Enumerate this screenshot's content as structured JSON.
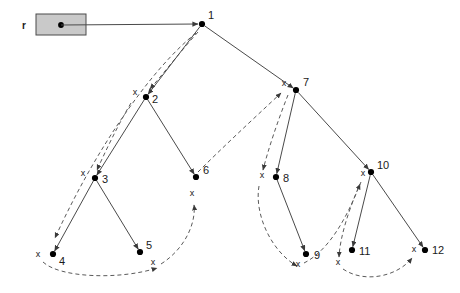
{
  "diagram": {
    "colors": {
      "node": "#000000",
      "edge": "#4a4a4a",
      "thread": "#5a5a5a",
      "root_box_fill": "#c9c9c9",
      "background": "#ffffff",
      "text": "#1a1a1a"
    },
    "root_pointer": {
      "label": "r",
      "box": {
        "x": 36,
        "y": 14,
        "w": 50,
        "h": 21
      },
      "dot": {
        "x": 61,
        "y": 25
      },
      "link_to": "1"
    },
    "nodes": [
      {
        "id": "1",
        "label": "1",
        "x": 202,
        "y": 24,
        "label_dx": 6,
        "label_dy": -5
      },
      {
        "id": "2",
        "label": "2",
        "x": 146,
        "y": 97,
        "label_dx": 6,
        "label_dy": 6
      },
      {
        "id": "3",
        "label": "3",
        "x": 95,
        "y": 178,
        "label_dx": 7,
        "label_dy": 5
      },
      {
        "id": "4",
        "label": "4",
        "x": 53,
        "y": 254,
        "label_dx": 6,
        "label_dy": 11
      },
      {
        "id": "5",
        "label": "5",
        "x": 140,
        "y": 252,
        "label_dx": 6,
        "label_dy": -3
      },
      {
        "id": "6",
        "label": "6",
        "x": 196,
        "y": 177,
        "label_dx": 7,
        "label_dy": -3
      },
      {
        "id": "7",
        "label": "7",
        "x": 296,
        "y": 90,
        "label_dx": 7,
        "label_dy": -4
      },
      {
        "id": "8",
        "label": "8",
        "x": 276,
        "y": 177,
        "label_dx": 7,
        "label_dy": 5
      },
      {
        "id": "9",
        "label": "9",
        "x": 306,
        "y": 254,
        "label_dx": 8,
        "label_dy": 5
      },
      {
        "id": "10",
        "label": "10",
        "x": 371,
        "y": 172,
        "label_dx": 6,
        "label_dy": -3
      },
      {
        "id": "11",
        "label": "11",
        "x": 352,
        "y": 250,
        "label_dx": 7,
        "label_dy": 5
      },
      {
        "id": "12",
        "label": "12",
        "x": 425,
        "y": 250,
        "label_dx": 7,
        "label_dy": 4
      }
    ],
    "edges": [
      {
        "from": "1",
        "to": "2",
        "side": "left"
      },
      {
        "from": "1",
        "to": "7",
        "side": "right"
      },
      {
        "from": "2",
        "to": "3",
        "side": "left"
      },
      {
        "from": "2",
        "to": "6",
        "side": "right"
      },
      {
        "from": "3",
        "to": "4",
        "side": "left"
      },
      {
        "from": "3",
        "to": "5",
        "side": "right"
      },
      {
        "from": "7",
        "to": "8",
        "side": "left"
      },
      {
        "from": "7",
        "to": "10",
        "side": "right"
      },
      {
        "from": "8",
        "to": "9",
        "side": "right"
      },
      {
        "from": "10",
        "to": "11",
        "side": "left"
      },
      {
        "from": "10",
        "to": "12",
        "side": "right"
      }
    ],
    "null_marks": [
      {
        "id": "x-at-2",
        "text": "x",
        "x": 135,
        "y": 95
      },
      {
        "id": "x-at-3",
        "text": "x",
        "x": 83,
        "y": 176
      },
      {
        "id": "x-at-4",
        "text": "x",
        "x": 38,
        "y": 257
      },
      {
        "id": "x-at-5",
        "text": "x",
        "x": 153,
        "y": 265
      },
      {
        "id": "x-at-6",
        "text": "x",
        "x": 192,
        "y": 196
      },
      {
        "id": "x-at-7",
        "text": "x",
        "x": 284,
        "y": 86
      },
      {
        "id": "x-at-8",
        "text": "x",
        "x": 262,
        "y": 178
      },
      {
        "id": "x-at-9",
        "text": "x",
        "x": 298,
        "y": 267
      },
      {
        "id": "x-at-10",
        "text": "x",
        "x": 363,
        "y": 176
      },
      {
        "id": "x-at-11",
        "text": "x",
        "x": 338,
        "y": 265
      },
      {
        "id": "x-at-12",
        "text": "x",
        "x": 414,
        "y": 252
      }
    ],
    "threads": [
      {
        "id": "thread-1-to-x2",
        "path": "M 198 32 C 180 52 163 74 150 89"
      },
      {
        "id": "thread-x2-to-x3",
        "path": "M 131 103 C 118 125 106 150 97 170"
      },
      {
        "id": "thread-1-to-x4",
        "path": "M 196 33 C 150 70 95 150 55 238"
      },
      {
        "id": "thread-x4-arc-x5",
        "path": "M 43 262 C 60 278 120 280 157 268"
      },
      {
        "id": "thread-x5-to-x6",
        "path": "M 161 264 C 186 248 196 222 194 205"
      },
      {
        "id": "thread-x6-to-7",
        "path": "M 198 172 C 222 148 250 122 281 93"
      },
      {
        "id": "thread-7-to-x8",
        "path": "M 288 95 C 278 120 268 150 263 170"
      },
      {
        "id": "thread-x8-to-x9",
        "path": "M 259 186 C 254 215 272 252 297 266"
      },
      {
        "id": "thread-x9-to-x10",
        "path": "M 304 263 C 330 250 348 215 360 184"
      },
      {
        "id": "thread-x10-to-x11",
        "path": "M 361 182 C 350 206 340 236 339 257"
      },
      {
        "id": "thread-x11-arc-x12",
        "path": "M 343 269 C 365 284 398 276 412 258"
      }
    ]
  }
}
